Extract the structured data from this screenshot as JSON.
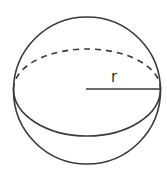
{
  "diagram": {
    "shape": "sphere",
    "radius_label": "r",
    "stroke_color": "#3a3a3a",
    "background": "#ffffff",
    "elements": [
      {
        "name": "outline",
        "type": "circle"
      },
      {
        "name": "equator-front",
        "type": "solid-arc"
      },
      {
        "name": "equator-back",
        "type": "dashed-arc"
      },
      {
        "name": "radius",
        "type": "line",
        "label": "r"
      }
    ]
  }
}
